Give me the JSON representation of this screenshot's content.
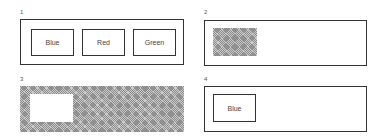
{
  "panels": [
    {
      "number": "1",
      "description": "Three buttons in a frame",
      "buttons": [
        {
          "label": "Blue"
        },
        {
          "label": "Red"
        },
        {
          "label": "Green"
        }
      ]
    },
    {
      "number": "2",
      "description": "Frame with hatched placeholder rectangle"
    },
    {
      "number": "3",
      "description": "Hatched frame with empty white rectangle"
    },
    {
      "number": "4",
      "description": "Frame with single button",
      "buttons": [
        {
          "label": "Blue"
        }
      ]
    }
  ]
}
